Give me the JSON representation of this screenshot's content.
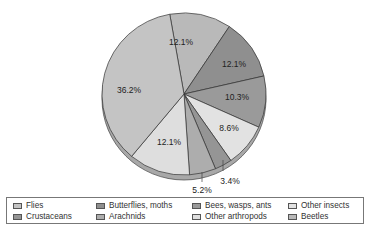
{
  "chart_data": {
    "type": "pie",
    "title": "",
    "slices": [
      {
        "label": "Beetles",
        "value": 12.1,
        "display": "12.1%",
        "color": "#b9b9b9"
      },
      {
        "label": "Butterflies, moths",
        "value": 12.1,
        "display": "12.1%",
        "color": "#8f8f8f"
      },
      {
        "label": "Bees, wasps, ants",
        "value": 10.3,
        "display": "10.3%",
        "color": "#9a9a9a"
      },
      {
        "label": "Other insects",
        "value": 8.6,
        "display": "8.6%",
        "color": "#e2e2e2"
      },
      {
        "label": "Crustaceans",
        "value": 3.4,
        "display": "3.4%",
        "color": "#959595"
      },
      {
        "label": "Arachnids",
        "value": 5.2,
        "display": "5.2%",
        "color": "#adadad"
      },
      {
        "label": "Other arthropods",
        "value": 12.1,
        "display": "12.1%",
        "color": "#dedede"
      },
      {
        "label": "Flies",
        "value": 36.2,
        "display": "36.2%",
        "color": "#c4c4c4"
      }
    ],
    "legend_position": "bottom",
    "start_angle_deg": -10
  },
  "legend": {
    "items": [
      {
        "label": "Flies",
        "color": "#c4c4c4"
      },
      {
        "label": "Butterflies, moths",
        "color": "#8f8f8f"
      },
      {
        "label": "Bees, wasps, ants",
        "color": "#9a9a9a"
      },
      {
        "label": "Other insects",
        "color": "#e2e2e2"
      },
      {
        "label": "Crustaceans",
        "color": "#959595"
      },
      {
        "label": "Arachnids",
        "color": "#adadad"
      },
      {
        "label": "Other arthropods",
        "color": "#dedede"
      },
      {
        "label": "Beetles",
        "color": "#b9b9b9"
      }
    ]
  }
}
